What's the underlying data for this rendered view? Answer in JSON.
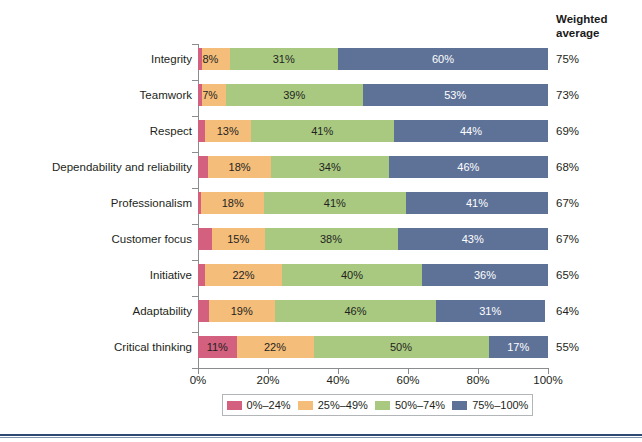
{
  "header": {
    "weighted_average_line1": "Weighted",
    "weighted_average_line2": "average"
  },
  "axis": {
    "x_ticks": [
      "0%",
      "20%",
      "40%",
      "60%",
      "80%",
      "100%"
    ],
    "x_tick_values": [
      0,
      20,
      40,
      60,
      80,
      100
    ]
  },
  "legend": {
    "items": [
      {
        "label": "0%–24%",
        "color": "#d2607e"
      },
      {
        "label": "25%–49%",
        "color": "#f5bd7a"
      },
      {
        "label": "50%–74%",
        "color": "#a9c981"
      },
      {
        "label": "75%–100%",
        "color": "#5e7298"
      }
    ]
  },
  "chart_data": {
    "type": "bar",
    "orientation": "horizontal",
    "stacked": true,
    "percent_stacked": true,
    "title": "",
    "xlabel": "",
    "ylabel": "",
    "xlim": [
      0,
      100
    ],
    "grid": false,
    "legend_position": "bottom",
    "categories": [
      "Integrity",
      "Teamwork",
      "Respect",
      "Dependability and reliability",
      "Professionalism",
      "Customer focus",
      "Initiative",
      "Adaptability",
      "Critical thinking"
    ],
    "series": [
      {
        "name": "0%–24%",
        "color": "#d2607e",
        "values": [
          1,
          1,
          2,
          3,
          1,
          4,
          2,
          3,
          11
        ]
      },
      {
        "name": "25%–49%",
        "color": "#f5bd7a",
        "values": [
          8,
          7,
          13,
          18,
          18,
          15,
          22,
          19,
          22
        ]
      },
      {
        "name": "50%–74%",
        "color": "#a9c981",
        "values": [
          31,
          39,
          41,
          34,
          41,
          38,
          40,
          46,
          50
        ]
      },
      {
        "name": "75%–100%",
        "color": "#5e7298",
        "values": [
          60,
          53,
          44,
          46,
          41,
          43,
          36,
          31,
          17
        ]
      }
    ],
    "data_labels": [
      [
        "1%",
        "8%",
        "31%",
        "60%"
      ],
      [
        "1%",
        "7%",
        "39%",
        "53%"
      ],
      [
        "2%",
        "13%",
        "41%",
        "44%"
      ],
      [
        "3%",
        "18%",
        "34%",
        "46%"
      ],
      [
        "1%",
        "18%",
        "41%",
        "41%"
      ],
      [
        "4%",
        "15%",
        "38%",
        "43%"
      ],
      [
        "2%",
        "22%",
        "40%",
        "36%"
      ],
      [
        "3%",
        "19%",
        "46%",
        "31%"
      ],
      [
        "11%",
        "22%",
        "50%",
        "17%"
      ]
    ],
    "weighted_average_label": "Weighted average",
    "weighted_average": [
      "75%",
      "73%",
      "69%",
      "68%",
      "67%",
      "67%",
      "65%",
      "64%",
      "55%"
    ]
  }
}
